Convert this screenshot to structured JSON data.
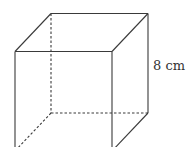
{
  "diagram": {
    "shape": "cube",
    "edge_label": "8 cm",
    "colors": {
      "stroke": "#3a3a3a",
      "text": "#333333",
      "background": "#ffffff"
    }
  }
}
